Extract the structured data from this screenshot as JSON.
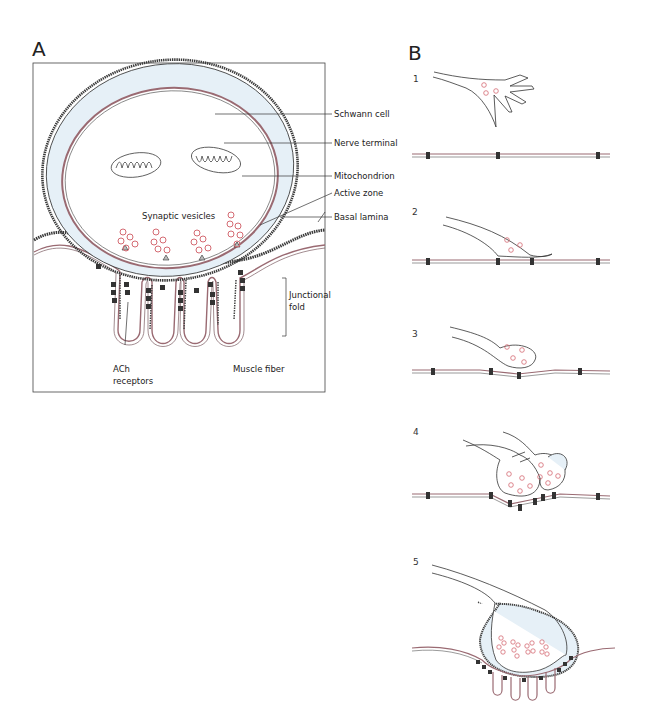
{
  "panel_a": {
    "letter": "A",
    "title": "Neuromuscular junction",
    "labels": {
      "schwann": "Schwann cell",
      "nerve": "Nerve terminal",
      "mito": "Mitochondrion",
      "active": "Active zone",
      "basal": "Basal lamina",
      "vesicles": "Synaptic vesicles",
      "fold1": "Junctional",
      "fold2": "fold",
      "ach1": "ACh",
      "ach2": "receptors",
      "muscle": "Muscle fiber"
    }
  },
  "panel_b": {
    "letter": "B",
    "stages": [
      "1",
      "2",
      "3",
      "4",
      "5"
    ]
  },
  "colors": {
    "membrane": "#9a6a72",
    "schwann_fill": "#e6f0f7",
    "vesicle": "#d46a72",
    "ink": "#2a2a2a",
    "receptor": "#333333"
  }
}
